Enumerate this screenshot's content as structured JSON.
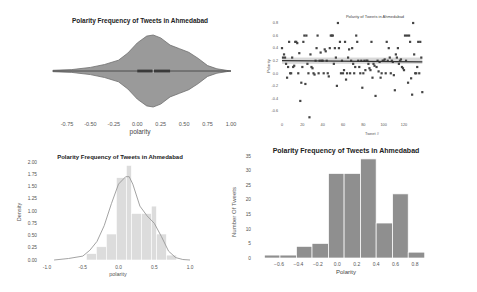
{
  "chart_data": [
    {
      "id": "violin",
      "type": "violin",
      "title": "Polarity Frequency of Tweets in Ahmedabad",
      "xlabel": "polarity",
      "ylabel": "",
      "xticks": [
        "-0.75",
        "-0.50",
        "-0.25",
        "0.00",
        "0.25",
        "0.50",
        "0.75",
        "1.00"
      ],
      "xtick_values": [
        -0.75,
        -0.5,
        -0.25,
        0.0,
        0.25,
        0.5,
        0.75,
        1.0
      ],
      "xlim": [
        -0.9,
        1.0
      ],
      "box": {
        "q1": 0.0,
        "median": 0.17,
        "q3": 0.35
      },
      "density_profile": {
        "x": [
          -0.9,
          -0.7,
          -0.5,
          -0.35,
          -0.2,
          -0.1,
          0.0,
          0.1,
          0.17,
          0.25,
          0.35,
          0.45,
          0.55,
          0.65,
          0.75,
          0.85,
          0.95,
          1.0
        ],
        "half_width": [
          0.02,
          0.04,
          0.1,
          0.18,
          0.3,
          0.5,
          0.78,
          0.97,
          1.0,
          0.92,
          0.72,
          0.62,
          0.52,
          0.35,
          0.15,
          0.06,
          0.02,
          0.0
        ]
      },
      "colors": {
        "fill": "#9a9a9a",
        "stroke": "#6e6e6e",
        "box": "#3a3a3a"
      },
      "grid": false
    },
    {
      "id": "scatter",
      "type": "scatter",
      "title": "Polarity of Tweets in Ahmedabad",
      "xlabel": "Tweet #",
      "ylabel": "Polarity",
      "xticks": [
        "0",
        "20",
        "40",
        "60",
        "80",
        "100",
        "120"
      ],
      "xtick_values": [
        0,
        20,
        40,
        60,
        80,
        100,
        120
      ],
      "yticks": [
        "0.8",
        "0.6",
        "0.4",
        "0.2",
        "0.0",
        "-0.2",
        "-0.4",
        "-0.6"
      ],
      "ytick_values": [
        0.8,
        0.6,
        0.4,
        0.2,
        0.0,
        -0.2,
        -0.4,
        -0.6
      ],
      "xlim": [
        0,
        140
      ],
      "ylim": [
        -0.75,
        0.9
      ],
      "regression": {
        "y_start": 0.2,
        "y_end": 0.18,
        "ci": 0.05
      },
      "x": [
        0,
        1,
        2,
        3,
        4,
        5,
        6,
        7,
        8,
        9,
        10,
        11,
        12,
        13,
        14,
        15,
        16,
        17,
        18,
        19,
        20,
        21,
        22,
        23,
        24,
        25,
        26,
        27,
        28,
        29,
        30,
        31,
        32,
        33,
        34,
        35,
        36,
        37,
        38,
        39,
        40,
        41,
        42,
        43,
        44,
        45,
        46,
        47,
        48,
        49,
        50,
        51,
        52,
        53,
        54,
        55,
        56,
        57,
        58,
        59,
        60,
        61,
        62,
        63,
        64,
        65,
        66,
        67,
        68,
        69,
        70,
        71,
        72,
        73,
        74,
        75,
        76,
        77,
        78,
        79,
        80,
        81,
        82,
        83,
        84,
        85,
        86,
        87,
        88,
        89,
        90,
        91,
        92,
        93,
        94,
        95,
        96,
        97,
        98,
        99,
        100,
        101,
        102,
        103,
        104,
        105,
        106,
        107,
        108,
        109,
        110,
        111,
        112,
        113,
        114,
        115,
        116,
        117,
        118,
        119,
        120,
        121,
        122,
        123,
        124,
        125,
        126,
        127,
        128,
        129,
        130,
        131,
        132,
        133,
        134,
        135,
        136,
        137,
        138
      ],
      "y": [
        0.4,
        0.25,
        0.3,
        0.25,
        0.15,
        -0.07,
        0.1,
        0.5,
        0.0,
        0.0,
        0.25,
        0.1,
        0.12,
        0.5,
        0.5,
        0.48,
        0.0,
        0.32,
        -0.44,
        -0.15,
        0.1,
        0.5,
        0.6,
        -0.17,
        0.6,
        0.15,
        0.0,
        -0.7,
        0.3,
        0.1,
        0.08,
        0.0,
        -0.02,
        0.2,
        0.4,
        0.6,
        0.0,
        0.2,
        0.33,
        0.2,
        0.2,
        0.0,
        0.38,
        0.35,
        0.2,
        0.0,
        -0.05,
        0.4,
        0.6,
        0.6,
        0.6,
        0.15,
        0.4,
        0.25,
        -0.2,
        0.8,
        0.4,
        0.5,
        0.0,
        0.2,
        0.0,
        0.05,
        0.5,
        -0.1,
        0.0,
        0.25,
        0.38,
        0.0,
        0.2,
        0.4,
        0.15,
        0.0,
        0.1,
        0.6,
        0.5,
        0.2,
        0.1,
        0.0,
        0.2,
        -0.23,
        0.0,
        0.2,
        0.05,
        0.2,
        0.2,
        0.15,
        0.08,
        0.05,
        0.5,
        -0.07,
        0.15,
        0.12,
        -0.36,
        0.1,
        0.2,
        0.03,
        0.18,
        -0.07,
        0.0,
        0.2,
        0.2,
        0.22,
        0.0,
        0.5,
        0.2,
        0.4,
        0.25,
        0.0,
        0.2,
        0.18,
        -0.03,
        -0.27,
        0.3,
        0.25,
        0.4,
        0.15,
        0.2,
        0.22,
        0.1,
        0.08,
        0.05,
        0.6,
        0.2,
        0.6,
        -0.15,
        0.6,
        0.5,
        -0.08,
        -0.34,
        0.8,
        0.3,
        0.0,
        0.0,
        0.1,
        0.5,
        0.0,
        0.5,
        0.25,
        -0.3,
        0.35
      ],
      "colors": {
        "point": "#444444",
        "line": "#333333",
        "band": "#cfcfcf"
      },
      "grid": false
    },
    {
      "id": "density-hist",
      "type": "bar",
      "title": "Polarity Frequency of Tweets in Ahmedabad",
      "xlabel": "polarity",
      "ylabel": "Density",
      "xticks": [
        "-1.0",
        "-0.5",
        "0.0",
        "0.5",
        "1.0"
      ],
      "xtick_values": [
        -1.0,
        -0.5,
        0.0,
        0.5,
        1.0
      ],
      "yticks": [
        "0.00",
        "0.25",
        "0.50",
        "0.75",
        "1.00",
        "1.25",
        "1.50",
        "1.75",
        "2.00"
      ],
      "ytick_values": [
        0.0,
        0.25,
        0.5,
        0.75,
        1.0,
        1.25,
        1.5,
        1.75,
        2.0
      ],
      "xlim": [
        -1.0,
        1.0
      ],
      "ylim": [
        0,
        2.0
      ],
      "bin_edges": [
        -0.45,
        -0.31,
        -0.17,
        -0.03,
        0.11,
        0.25,
        0.39,
        0.53,
        0.67,
        0.81
      ],
      "bins": [
        {
          "x0": -0.45,
          "x1": -0.31,
          "value": 0.13
        },
        {
          "x0": -0.31,
          "x1": -0.17,
          "value": 0.27
        },
        {
          "x0": -0.17,
          "x1": -0.03,
          "value": 0.53
        },
        {
          "x0": -0.03,
          "x1": 0.11,
          "value": 1.68
        },
        {
          "x0": 0.11,
          "x1": 0.18,
          "value": 1.93
        },
        {
          "x0": 0.18,
          "x1": 0.32,
          "value": 0.95
        },
        {
          "x0": 0.32,
          "x1": 0.46,
          "value": 0.95
        },
        {
          "x0": 0.46,
          "x1": 0.53,
          "value": 1.1
        },
        {
          "x0": 0.53,
          "x1": 0.67,
          "value": 0.53
        },
        {
          "x0": 0.67,
          "x1": 0.81,
          "value": 0.1
        }
      ],
      "kde": {
        "x": [
          -0.9,
          -0.7,
          -0.5,
          -0.4,
          -0.3,
          -0.2,
          -0.1,
          0.0,
          0.1,
          0.15,
          0.2,
          0.3,
          0.4,
          0.5,
          0.6,
          0.7,
          0.8,
          0.9,
          1.0
        ],
        "y": [
          0.0,
          0.03,
          0.08,
          0.2,
          0.38,
          0.7,
          1.15,
          1.55,
          1.7,
          1.7,
          1.55,
          1.1,
          0.9,
          0.75,
          0.48,
          0.18,
          0.05,
          0.01,
          0.0
        ]
      },
      "colors": {
        "bar": "#dcdcdc",
        "bar_edge": "#ffffff",
        "kde": "#999999"
      },
      "grid": false
    },
    {
      "id": "count-hist",
      "type": "bar",
      "title": "Polarity Frequency of Tweets in Ahmedabad",
      "xlabel": "Polarity",
      "ylabel": "Number Of Tweets",
      "xticks": [
        "-0.6",
        "-0.4",
        "-0.2",
        "0.0",
        "0.2",
        "0.4",
        "0.6",
        "0.8"
      ],
      "xtick_values": [
        -0.6,
        -0.4,
        -0.2,
        0.0,
        0.2,
        0.4,
        0.6,
        0.8
      ],
      "yticks": [
        "0",
        "5",
        "10",
        "15",
        "20",
        "25",
        "30",
        "35"
      ],
      "ytick_values": [
        0,
        5,
        10,
        15,
        20,
        25,
        30,
        35
      ],
      "xlim": [
        -0.75,
        0.92
      ],
      "ylim": [
        0,
        35
      ],
      "bins": [
        {
          "x0": -0.75,
          "x1": -0.59,
          "value": 1
        },
        {
          "x0": -0.59,
          "x1": -0.42,
          "value": 1
        },
        {
          "x0": -0.42,
          "x1": -0.26,
          "value": 4
        },
        {
          "x0": -0.26,
          "x1": -0.09,
          "value": 5
        },
        {
          "x0": -0.09,
          "x1": 0.07,
          "value": 29
        },
        {
          "x0": 0.07,
          "x1": 0.24,
          "value": 29
        },
        {
          "x0": 0.24,
          "x1": 0.4,
          "value": 34
        },
        {
          "x0": 0.4,
          "x1": 0.57,
          "value": 12
        },
        {
          "x0": 0.57,
          "x1": 0.73,
          "value": 22
        },
        {
          "x0": 0.73,
          "x1": 0.9,
          "value": 2
        }
      ],
      "colors": {
        "bar": "#8f8f8f",
        "bar_edge": "#ffffff"
      },
      "grid": false
    }
  ]
}
